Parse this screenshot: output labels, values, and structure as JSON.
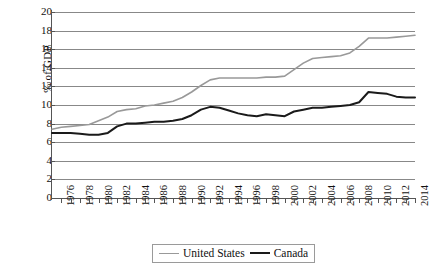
{
  "chart_data": {
    "type": "line",
    "title": "",
    "xlabel": "",
    "ylabel": "% of GDP",
    "ylim": [
      0,
      20
    ],
    "ytick_step": 2,
    "yticks": [
      20,
      18,
      16,
      14,
      12,
      10,
      8,
      6,
      4,
      2,
      0
    ],
    "xlim": [
      1975,
      2014
    ],
    "xtick_step": 1,
    "xtick_labels": [
      "1976",
      "1978",
      "1980",
      "1982",
      "1984",
      "1986",
      "1988",
      "1990",
      "1992",
      "1994",
      "1996",
      "1998",
      "2000",
      "2002",
      "2004",
      "2006",
      "2008",
      "2010",
      "2012",
      "2014"
    ],
    "xtick_label_step": 2,
    "grid": "horizontal",
    "legend_position": "bottom-center",
    "x": [
      1975,
      1976,
      1977,
      1978,
      1979,
      1980,
      1981,
      1982,
      1983,
      1984,
      1985,
      1986,
      1987,
      1988,
      1989,
      1990,
      1991,
      1992,
      1993,
      1994,
      1995,
      1996,
      1997,
      1998,
      1999,
      2000,
      2001,
      2002,
      2003,
      2004,
      2005,
      2006,
      2007,
      2008,
      2009,
      2010,
      2011,
      2012,
      2013,
      2014
    ],
    "series": [
      {
        "name": "United States",
        "color": "#999999",
        "width": 1.6,
        "values": [
          7.4,
          7.6,
          7.7,
          7.8,
          7.9,
          8.3,
          8.7,
          9.3,
          9.5,
          9.6,
          9.9,
          10.0,
          10.2,
          10.4,
          10.8,
          11.4,
          12.1,
          12.7,
          12.9,
          12.9,
          12.9,
          12.9,
          12.9,
          13.0,
          13.0,
          13.1,
          13.8,
          14.5,
          15.0,
          15.1,
          15.2,
          15.3,
          15.6,
          16.3,
          17.2,
          17.2,
          17.2,
          17.3,
          17.4,
          17.5
        ]
      },
      {
        "name": "Canada",
        "color": "#1a1a1a",
        "width": 2.0,
        "values": [
          7.0,
          7.0,
          7.0,
          6.9,
          6.8,
          6.8,
          7.0,
          7.7,
          8.0,
          8.0,
          8.1,
          8.2,
          8.2,
          8.3,
          8.5,
          8.9,
          9.5,
          9.8,
          9.7,
          9.4,
          9.1,
          8.9,
          8.8,
          9.0,
          8.9,
          8.8,
          9.3,
          9.5,
          9.7,
          9.7,
          9.8,
          9.9,
          10.0,
          10.3,
          11.4,
          11.3,
          11.2,
          10.9,
          10.8,
          10.8
        ]
      }
    ]
  },
  "legend": {
    "entries": [
      {
        "label": "United States"
      },
      {
        "label": "Canada"
      }
    ]
  },
  "axis": {
    "y_title": "% of GDP"
  }
}
